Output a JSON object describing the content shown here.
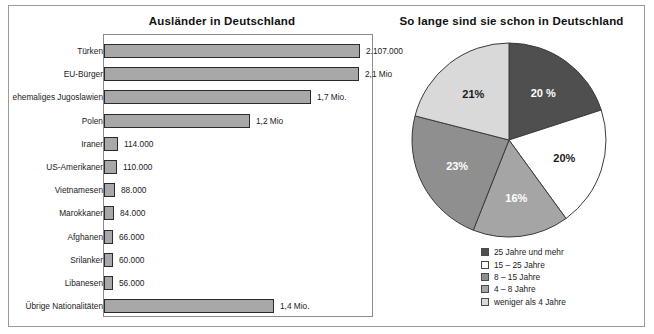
{
  "page": {
    "background": "#ffffff",
    "border_color": "#9a9a9a"
  },
  "bar_panel": {
    "title": "Ausländer in Deutschland"
  },
  "pie_panel": {
    "title": "So lange sind sie schon in Deutschland"
  },
  "legend": {
    "items": [
      {
        "label": "25 Jahre und mehr",
        "color": "#4f4f4f"
      },
      {
        "label": "15 – 25 Jahre",
        "color": "#ffffff"
      },
      {
        "label": "8 – 15 Jahre",
        "color": "#8f8f8f"
      },
      {
        "label": "4 – 8 Jahre",
        "color": "#a5a5a5"
      },
      {
        "label": "weniger als 4 Jahre",
        "color": "#d9d9d9"
      }
    ]
  },
  "chart_data": [
    {
      "type": "bar",
      "orientation": "horizontal",
      "title": "Ausländer in Deutschland",
      "xlabel": "",
      "ylabel": "",
      "grid": false,
      "axis_visible_frame": true,
      "bar_color": "#a8a8a8",
      "bar_border_color": "#2b2b2b",
      "xlim": [
        0,
        2107000
      ],
      "categories": [
        "Türken",
        "EU-Bürger",
        "ehemaliges Jugoslawien",
        "Polen",
        "Iraner",
        "US-Amerikaner",
        "Vietnamesen",
        "Marokkaner",
        "Afghanen",
        "Srilanker",
        "Libanesen",
        "Übrige Nationalitäten"
      ],
      "values": [
        2107000,
        2100000,
        1700000,
        1200000,
        114000,
        110000,
        88000,
        84000,
        66000,
        60000,
        56000,
        1400000
      ],
      "value_labels": [
        "2.107.000",
        "2,1 Mio",
        "1,7 Mio.",
        "1,2 Mio",
        "114.000",
        "110.000",
        "88.000",
        "84.000",
        "66.000",
        "60.000",
        "56.000",
        "1,4 Mio."
      ]
    },
    {
      "type": "pie",
      "title": "So lange sind sie schon in Deutschland",
      "legend_position": "bottom",
      "start_angle_deg": 0,
      "direction": "clockwise",
      "labels": [
        "25 Jahre und mehr",
        "15 – 25 Jahre",
        "4 – 8 Jahre",
        "8 – 15 Jahre",
        "weniger als 4 Jahre"
      ],
      "values": [
        20,
        20,
        16,
        23,
        21
      ],
      "slice_labels": [
        "20 %",
        "20%",
        "16%",
        "23%",
        "21%"
      ],
      "colors": [
        "#4f4f4f",
        "#ffffff",
        "#a5a5a5",
        "#8f8f8f",
        "#d9d9d9"
      ],
      "slice_label_colors": [
        "#ffffff",
        "#1a1a1a",
        "#ffffff",
        "#ffffff",
        "#1a1a1a"
      ]
    }
  ]
}
